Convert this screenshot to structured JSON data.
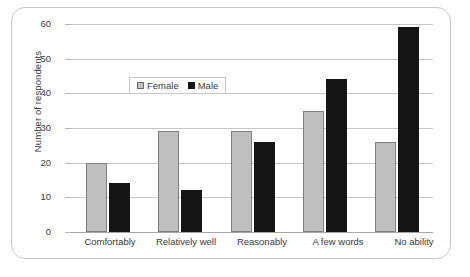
{
  "chart_data": {
    "type": "bar",
    "title": "",
    "xlabel": "",
    "ylabel": "Number of respondents",
    "ylim": [
      0,
      60
    ],
    "ytick_step": 10,
    "yticks": [
      "60",
      "50",
      "40",
      "30",
      "20",
      "10",
      "0"
    ],
    "grid": true,
    "legend_position": "inside-upper-center",
    "categories": [
      "Comfortably",
      "Relatively well",
      "Reasonably",
      "A few words",
      "No ability"
    ],
    "series": [
      {
        "name": "Female",
        "color": "#bfbfbf",
        "values": [
          20,
          29,
          29,
          35,
          26
        ]
      },
      {
        "name": "Male",
        "color": "#151515",
        "values": [
          14,
          12,
          26,
          44,
          59
        ]
      }
    ]
  },
  "legend": {
    "female_label": "Female",
    "male_label": "Male"
  },
  "caption": {
    "text": ""
  }
}
